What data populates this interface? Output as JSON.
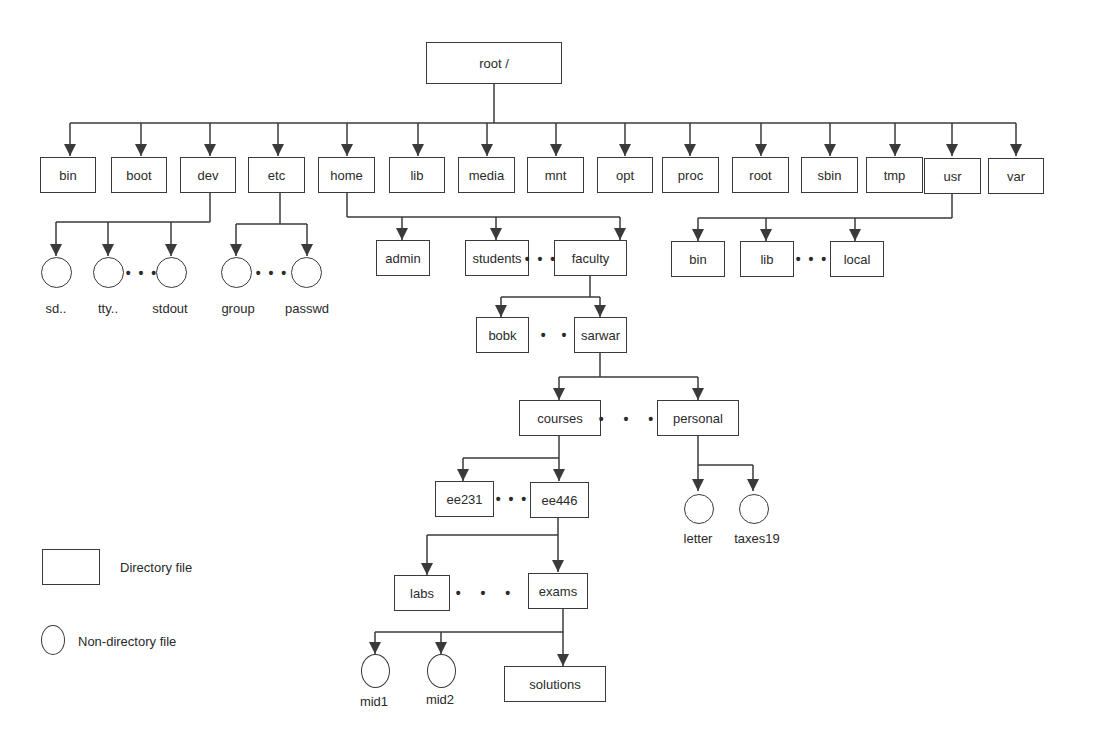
{
  "diagram": {
    "root": "root /",
    "level1": [
      "bin",
      "boot",
      "dev",
      "etc",
      "home",
      "lib",
      "media",
      "mnt",
      "opt",
      "proc",
      "root",
      "sbin",
      "tmp",
      "usr",
      "var"
    ],
    "dev_children": [
      "sd..",
      "tty..",
      "stdout"
    ],
    "etc_children": [
      "group",
      "passwd"
    ],
    "home_children": [
      "admin",
      "students",
      "faculty"
    ],
    "usr_children": [
      "bin",
      "lib",
      "local"
    ],
    "faculty_children": [
      "bobk",
      "sarwar"
    ],
    "sarwar_children": [
      "courses",
      "personal"
    ],
    "courses_children": [
      "ee231",
      "ee446"
    ],
    "personal_children": [
      "letter",
      "taxes19"
    ],
    "ee446_children": [
      "labs",
      "exams"
    ],
    "exams_children": [
      "mid1",
      "mid2",
      "solutions"
    ],
    "ellipsis": "• • •"
  },
  "legend": {
    "directory": "Directory file",
    "non_directory": "Non-directory file"
  },
  "colors": {
    "line": "#3a3a3a",
    "text": "#2a2a2a",
    "background": "#ffffff"
  }
}
